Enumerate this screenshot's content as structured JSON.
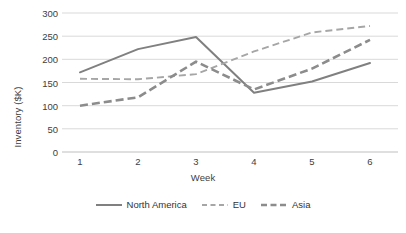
{
  "chart_data": {
    "type": "line",
    "title": "",
    "xlabel": "Week",
    "ylabel": "Inventory ($K)",
    "x": [
      1,
      2,
      3,
      4,
      5,
      6
    ],
    "categories": [
      "1",
      "2",
      "3",
      "4",
      "5",
      "6"
    ],
    "xtick_labels": [
      "1",
      "2",
      "3",
      "4",
      "5",
      "6"
    ],
    "ytick_labels": [
      "0",
      "50",
      "100",
      "150",
      "200",
      "250",
      "300"
    ],
    "ytick_values": [
      0,
      50,
      100,
      150,
      200,
      250,
      300
    ],
    "ylim": [
      0,
      300
    ],
    "xlim": [
      0.65,
      6.35
    ],
    "grid": "horizontal",
    "legend_position": "bottom",
    "series": [
      {
        "name": "North America",
        "values": [
          172,
          222,
          248,
          128,
          152,
          192
        ],
        "style": "solid",
        "color": "#808080"
      },
      {
        "name": "EU",
        "values": [
          158,
          157,
          168,
          217,
          258,
          272
        ],
        "style": "dashed-fine",
        "color": "#a6a6a6"
      },
      {
        "name": "Asia",
        "values": [
          100,
          118,
          195,
          135,
          180,
          242
        ],
        "style": "dashed-bold",
        "color": "#8c8c8c"
      }
    ]
  },
  "colors": {
    "north_america": "#808080",
    "eu": "#a6a6a6",
    "asia": "#8c8c8c",
    "grid": "#d9d9d9",
    "text": "#404040",
    "background": "#ffffff"
  }
}
